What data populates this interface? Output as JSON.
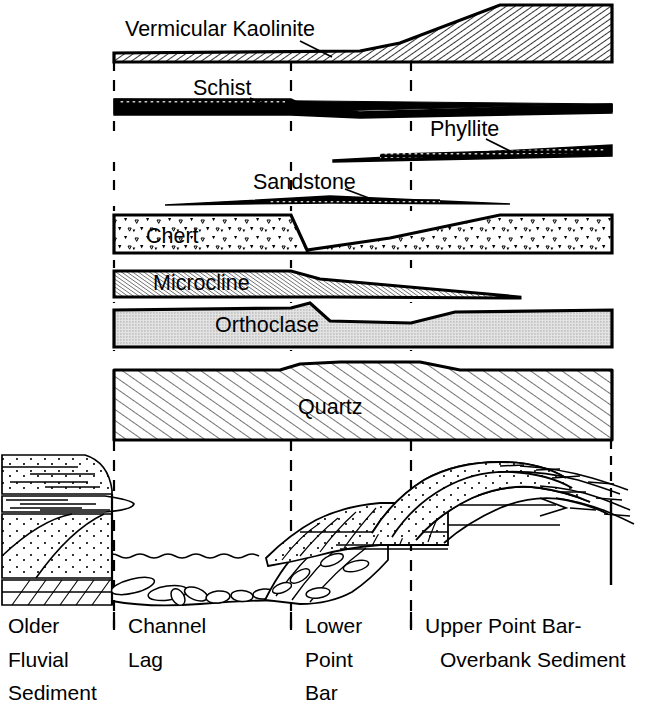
{
  "figure": {
    "type": "stratigraphic-mineral-profile-diagram"
  },
  "mineral_bands": [
    {
      "id": "vermicular-kaolinite",
      "label": "Vermicular Kaolinite",
      "fill_pattern": "diagonal-hatch-fine",
      "label_x": 125,
      "label_y": 35,
      "leader": {
        "x1": 300,
        "y1": 40,
        "x2": 330,
        "y2": 56
      }
    },
    {
      "id": "schist",
      "label": "Schist",
      "fill_pattern": "solid-black",
      "label_x": 193,
      "label_y": 93,
      "leader": {
        "x1": 252,
        "y1": 97,
        "x2": 275,
        "y2": 107
      }
    },
    {
      "id": "phyllite",
      "label": "Phyllite",
      "fill_pattern": "solid-black-speckled",
      "label_x": 430,
      "label_y": 134,
      "leader": {
        "x1": 487,
        "y1": 138,
        "x2": 510,
        "y2": 150
      }
    },
    {
      "id": "sandstone",
      "label": "Sandstone",
      "fill_pattern": "solid-black-thin",
      "label_x": 253,
      "label_y": 187,
      "leader": {
        "x1": 345,
        "y1": 188,
        "x2": 372,
        "y2": 199
      }
    },
    {
      "id": "chert",
      "label": "Chert",
      "fill_pattern": "triangle-stipple",
      "label_x": 146,
      "label_y": 241
    },
    {
      "id": "microcline",
      "label": "Microcline",
      "fill_pattern": "diagonal-hatch-dense",
      "label_x": 153,
      "label_y": 288
    },
    {
      "id": "orthoclase",
      "label": "Orthoclase",
      "fill_pattern": "dotted-grey",
      "label_x": 215,
      "label_y": 330
    },
    {
      "id": "quartz",
      "label": "Quartz",
      "fill_pattern": "diagonal-hatch-wide",
      "label_x": 298,
      "label_y": 412
    }
  ],
  "zones": [
    {
      "id": "older-fluvial-sediment",
      "lines": [
        "Older",
        "Fluvial",
        "Sediment"
      ],
      "x": 8,
      "boundary_x": 114
    },
    {
      "id": "channel-lag",
      "lines": [
        "Channel",
        "Lag"
      ],
      "x": 128,
      "boundary_x": 291
    },
    {
      "id": "lower-point-bar",
      "lines": [
        "Lower",
        "Point",
        "Bar"
      ],
      "x": 305,
      "boundary_x": 411
    },
    {
      "id": "upper-point-bar-overbank-sediment",
      "lines": [
        "Upper Point Bar-",
        "Overbank Sediment"
      ],
      "x": 425,
      "boundary_x": 611
    }
  ],
  "zone_boundaries_x": [
    114,
    291,
    411,
    611
  ],
  "cross_section": {
    "id": "point-bar-cross-section",
    "caption": "Channel cross-section with older fluvial sediment bank, channel lag gravels, lower point bar and upper point bar / overbank sediment"
  },
  "colors": {
    "ink": "#000000",
    "paper": "#ffffff",
    "orthoclase_grey": "#d4d4d4",
    "microcline_grey": "#bfbfbf"
  }
}
